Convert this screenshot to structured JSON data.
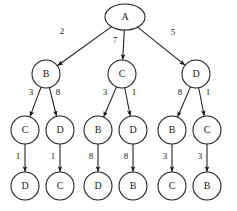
{
  "diagram": {
    "type": "directed-tree",
    "title": "",
    "background_color": "#ffffff",
    "stroke_color": "#1a1a1a",
    "nodes": [
      {
        "id": "n0",
        "label": "A",
        "shape": "ellipse",
        "cx": 125,
        "cy": 17,
        "rx": 20,
        "ry": 13,
        "level": 0
      },
      {
        "id": "n1",
        "label": "B",
        "shape": "circle",
        "cx": 46,
        "cy": 74,
        "rx": 14,
        "ry": 14,
        "level": 1
      },
      {
        "id": "n2",
        "label": "C",
        "shape": "circle",
        "cx": 122,
        "cy": 74,
        "rx": 14,
        "ry": 14,
        "level": 1
      },
      {
        "id": "n3",
        "label": "D",
        "shape": "circle",
        "cx": 196,
        "cy": 74,
        "rx": 14,
        "ry": 14,
        "level": 1
      },
      {
        "id": "n4",
        "label": "C",
        "shape": "circle",
        "cx": 25,
        "cy": 130,
        "rx": 14,
        "ry": 14,
        "level": 2
      },
      {
        "id": "n5",
        "label": "D",
        "shape": "circle",
        "cx": 60,
        "cy": 130,
        "rx": 14,
        "ry": 14,
        "level": 2
      },
      {
        "id": "n6",
        "label": "B",
        "shape": "circle",
        "cx": 98,
        "cy": 130,
        "rx": 14,
        "ry": 14,
        "level": 2
      },
      {
        "id": "n7",
        "label": "D",
        "shape": "circle",
        "cx": 133,
        "cy": 130,
        "rx": 14,
        "ry": 14,
        "level": 2
      },
      {
        "id": "n8",
        "label": "B",
        "shape": "circle",
        "cx": 172,
        "cy": 130,
        "rx": 14,
        "ry": 14,
        "level": 2
      },
      {
        "id": "n9",
        "label": "C",
        "shape": "circle",
        "cx": 207,
        "cy": 130,
        "rx": 14,
        "ry": 14,
        "level": 2
      },
      {
        "id": "n10",
        "label": "D",
        "shape": "circle",
        "cx": 25,
        "cy": 186,
        "rx": 14,
        "ry": 14,
        "level": 3
      },
      {
        "id": "n11",
        "label": "C",
        "shape": "circle",
        "cx": 60,
        "cy": 186,
        "rx": 14,
        "ry": 14,
        "level": 3
      },
      {
        "id": "n12",
        "label": "D",
        "shape": "circle",
        "cx": 98,
        "cy": 186,
        "rx": 14,
        "ry": 14,
        "level": 3
      },
      {
        "id": "n13",
        "label": "B",
        "shape": "circle",
        "cx": 133,
        "cy": 186,
        "rx": 14,
        "ry": 14,
        "level": 3
      },
      {
        "id": "n14",
        "label": "C",
        "shape": "circle",
        "cx": 172,
        "cy": 186,
        "rx": 14,
        "ry": 14,
        "level": 3
      },
      {
        "id": "n15",
        "label": "B",
        "shape": "circle",
        "cx": 207,
        "cy": 186,
        "rx": 14,
        "ry": 14,
        "level": 3
      }
    ],
    "edges": [
      {
        "from": "n0",
        "to": "n1",
        "weight": "2",
        "lx": 62,
        "ly": 32
      },
      {
        "from": "n0",
        "to": "n2",
        "weight": "7",
        "lx": 115,
        "ly": 41
      },
      {
        "from": "n0",
        "to": "n3",
        "weight": "5",
        "lx": 173,
        "ly": 33
      },
      {
        "from": "n1",
        "to": "n4",
        "weight": "3",
        "lx": 31,
        "ly": 93
      },
      {
        "from": "n1",
        "to": "n5",
        "weight": "8",
        "lx": 58,
        "ly": 93
      },
      {
        "from": "n2",
        "to": "n6",
        "weight": "3",
        "lx": 105,
        "ly": 93
      },
      {
        "from": "n2",
        "to": "n7",
        "weight": "1",
        "lx": 134,
        "ly": 93
      },
      {
        "from": "n3",
        "to": "n8",
        "weight": "8",
        "lx": 180,
        "ly": 93
      },
      {
        "from": "n3",
        "to": "n9",
        "weight": "1",
        "lx": 208,
        "ly": 93
      },
      {
        "from": "n4",
        "to": "n10",
        "weight": "1",
        "lx": 18,
        "ly": 157
      },
      {
        "from": "n5",
        "to": "n11",
        "weight": "1",
        "lx": 53,
        "ly": 157
      },
      {
        "from": "n6",
        "to": "n12",
        "weight": "8",
        "lx": 91,
        "ly": 157
      },
      {
        "from": "n7",
        "to": "n13",
        "weight": "8",
        "lx": 126,
        "ly": 157
      },
      {
        "from": "n8",
        "to": "n14",
        "weight": "3",
        "lx": 165,
        "ly": 157
      },
      {
        "from": "n9",
        "to": "n15",
        "weight": "3",
        "lx": 200,
        "ly": 157
      }
    ]
  }
}
